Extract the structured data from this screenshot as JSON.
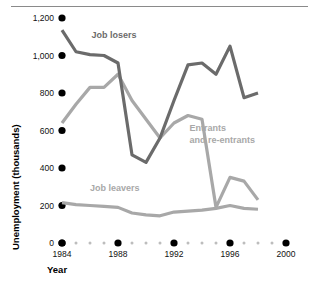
{
  "chart_data": {
    "type": "line",
    "title": "",
    "xlabel": "Year",
    "ylabel": "Unemployment (thousands)",
    "xlim": [
      1984,
      2000
    ],
    "ylim": [
      0,
      1200
    ],
    "grid": false,
    "legend_position": "inline-annotations",
    "x": [
      1984,
      1985,
      1986,
      1987,
      1988,
      1989,
      1990,
      1991,
      1992,
      1993,
      1994,
      1995,
      1996,
      1997,
      1998
    ],
    "y_ticks": [
      0,
      200,
      400,
      600,
      800,
      1000,
      1200
    ],
    "y_tick_labels": [
      "0",
      "200",
      "400",
      "600",
      "800",
      "1,000",
      "1,200"
    ],
    "x_ticks_major": [
      1984,
      1988,
      1992,
      1996,
      2000
    ],
    "x_tick_labels": [
      "1984",
      "1988",
      "1992",
      "1996",
      "2000"
    ],
    "x_ticks_minor": [
      1985,
      1986,
      1987,
      1989,
      1990,
      1991,
      1993,
      1994,
      1995,
      1997,
      1998,
      1999
    ],
    "series": [
      {
        "name": "Job losers",
        "color": "#6b6b6b",
        "label_x": 1986.1,
        "label_y": 1095,
        "values": [
          1135,
          1020,
          1005,
          1000,
          960,
          470,
          430,
          560,
          760,
          950,
          960,
          900,
          1050,
          775,
          800
        ]
      },
      {
        "name": "Entrants and re-entrants",
        "color": "#a8a8a8",
        "label_line1": "Entrants",
        "label_line2": "and re-entrants",
        "label_x": 1993.1,
        "label_y": 600,
        "values": [
          640,
          740,
          830,
          830,
          900,
          760,
          660,
          560,
          640,
          680,
          660,
          190,
          350,
          330,
          230
        ]
      },
      {
        "name": "Job leavers",
        "color": "#a8a8a8",
        "label_x": 1986.0,
        "label_y": 280,
        "values": [
          215,
          205,
          200,
          195,
          190,
          160,
          150,
          145,
          165,
          170,
          175,
          185,
          200,
          185,
          180
        ]
      }
    ]
  }
}
